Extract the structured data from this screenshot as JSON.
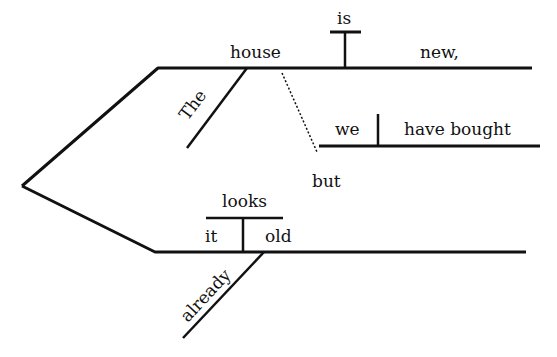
{
  "diagram": {
    "type": "sentence-diagram",
    "sentence": "The house is new, but we have bought it already. / it looks old",
    "colors": {
      "line": "#111111",
      "background": "#ffffff"
    },
    "clause_1": {
      "subject": "house",
      "verb": "is",
      "predicate": "new,",
      "modifier": "The"
    },
    "clause_2": {
      "subject": "we",
      "verb": "have bought",
      "connector": "but"
    },
    "clause_3": {
      "linking_verb": "looks",
      "subject": "it",
      "complement": "old",
      "modifier": "already"
    }
  }
}
